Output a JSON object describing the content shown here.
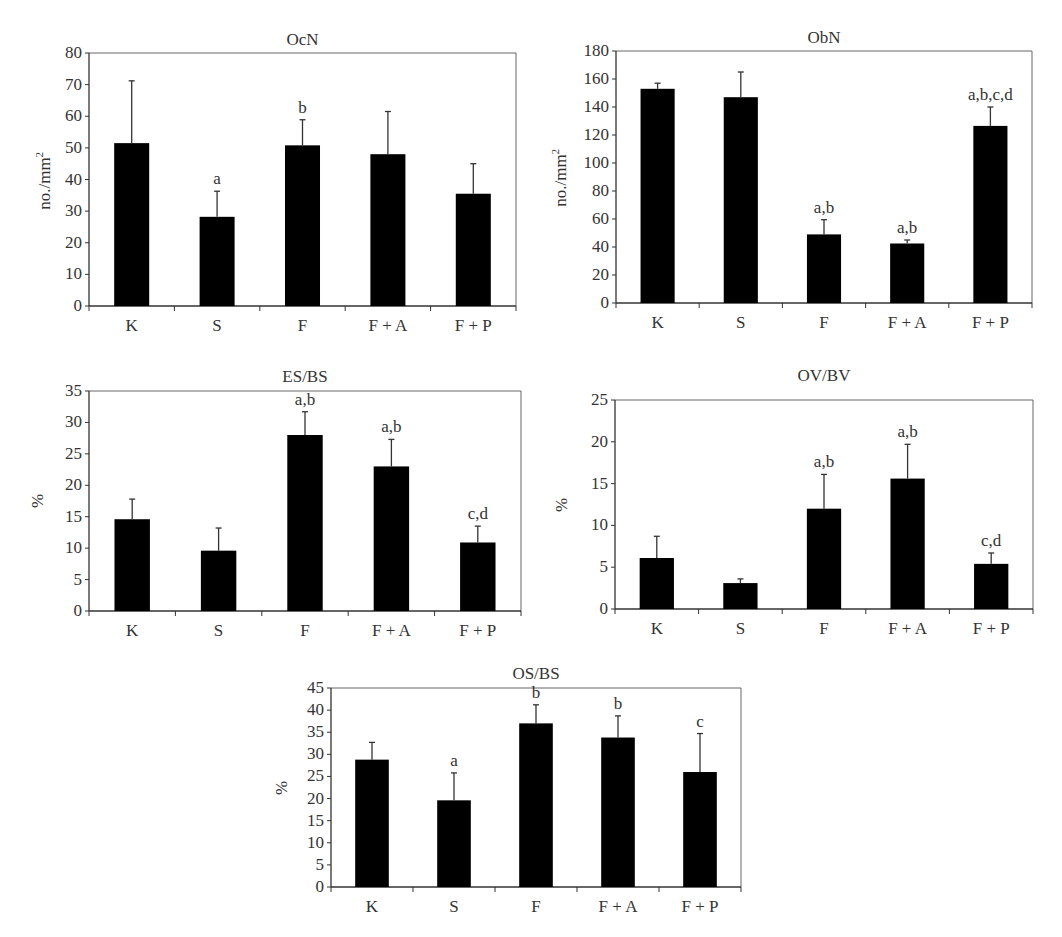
{
  "chart_data": [
    {
      "type": "bar",
      "title": "OcN",
      "xlabel": "",
      "ylabel": "no./mm²",
      "ylim": [
        0,
        80
      ],
      "yticks": [
        0,
        10,
        20,
        30,
        40,
        50,
        60,
        70,
        80
      ],
      "categories": [
        "K",
        "S",
        "F",
        "F + A",
        "F + P"
      ],
      "values": [
        51.5,
        28.2,
        50.8,
        48,
        35.5
      ],
      "error_upper": [
        71.2,
        36.3,
        58.9,
        61.5,
        45
      ],
      "annotations": [
        "",
        "a",
        "b",
        "",
        ""
      ],
      "grid": false,
      "bar_color": "#000000"
    },
    {
      "type": "bar",
      "title": "ObN",
      "xlabel": "",
      "ylabel": "no./mm²",
      "ylim": [
        0,
        180
      ],
      "yticks": [
        0,
        20,
        40,
        60,
        80,
        100,
        120,
        140,
        160,
        180
      ],
      "categories": [
        "K",
        "S",
        "F",
        "F + A",
        "F + P"
      ],
      "values": [
        153,
        147,
        49,
        42.5,
        126.5
      ],
      "error_upper": [
        157,
        165,
        59.5,
        45,
        140
      ],
      "annotations": [
        "",
        "",
        "a,b",
        "a,b",
        "a,b,c,d"
      ],
      "grid": false,
      "bar_color": "#000000"
    },
    {
      "type": "bar",
      "title": "ES/BS",
      "xlabel": "",
      "ylabel": "%",
      "ylim": [
        0,
        35
      ],
      "yticks": [
        0,
        5,
        10,
        15,
        20,
        25,
        30,
        35
      ],
      "categories": [
        "K",
        "S",
        "F",
        "F + A",
        "F + P"
      ],
      "values": [
        14.6,
        9.6,
        28,
        23,
        10.9
      ],
      "error_upper": [
        17.8,
        13.2,
        31.7,
        27.3,
        13.5
      ],
      "annotations": [
        "",
        "",
        "a,b",
        "a,b",
        "c,d"
      ],
      "grid": false,
      "bar_color": "#000000"
    },
    {
      "type": "bar",
      "title": "OV/BV",
      "xlabel": "",
      "ylabel": "%",
      "ylim": [
        0,
        25
      ],
      "yticks": [
        0,
        5,
        10,
        15,
        20,
        25
      ],
      "categories": [
        "K",
        "S",
        "F",
        "F + A",
        "F + P"
      ],
      "values": [
        6.1,
        3.1,
        12,
        15.6,
        5.4
      ],
      "error_upper": [
        8.7,
        3.6,
        16.1,
        19.7,
        6.7
      ],
      "annotations": [
        "",
        "",
        "a,b",
        "a,b",
        "c,d"
      ],
      "grid": false,
      "bar_color": "#000000"
    },
    {
      "type": "bar",
      "title": "OS/BS",
      "xlabel": "",
      "ylabel": "%",
      "ylim": [
        0,
        45
      ],
      "yticks": [
        0,
        5,
        10,
        15,
        20,
        25,
        30,
        35,
        40,
        45
      ],
      "categories": [
        "K",
        "S",
        "F",
        "F + A",
        "F + P"
      ],
      "values": [
        28.8,
        19.6,
        37,
        33.8,
        26
      ],
      "error_upper": [
        32.7,
        25.8,
        41.2,
        38.7,
        34.7
      ],
      "annotations": [
        "",
        "a",
        "b",
        "b",
        "c"
      ],
      "grid": false,
      "bar_color": "#000000"
    }
  ],
  "charts": [
    {
      "title": "OcN",
      "ylabel": "no./mm²"
    },
    {
      "title": "ObN",
      "ylabel": "no./mm²"
    },
    {
      "title": "ES/BS",
      "ylabel": "%"
    },
    {
      "title": "OV/BV",
      "ylabel": "%"
    },
    {
      "title": "OS/BS",
      "ylabel": "%"
    }
  ]
}
